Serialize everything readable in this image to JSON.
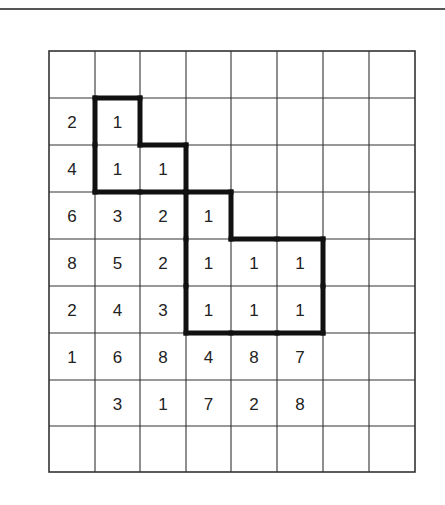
{
  "puzzle": {
    "columns": 8,
    "rows": 9,
    "grid": [
      [
        "",
        "",
        "",
        "",
        "",
        "",
        "",
        ""
      ],
      [
        "2",
        "1",
        "",
        "",
        "",
        "",
        "",
        ""
      ],
      [
        "4",
        "1",
        "1",
        "",
        "",
        "",
        "",
        ""
      ],
      [
        "6",
        "3",
        "2",
        "1",
        "",
        "",
        "",
        ""
      ],
      [
        "8",
        "5",
        "2",
        "1",
        "1",
        "1",
        "",
        ""
      ],
      [
        "2",
        "4",
        "3",
        "1",
        "1",
        "1",
        "",
        ""
      ],
      [
        "1",
        "6",
        "8",
        "4",
        "8",
        "7",
        "",
        ""
      ],
      [
        "",
        "3",
        "1",
        "7",
        "2",
        "8",
        "",
        ""
      ],
      [
        "",
        "",
        "",
        "",
        "",
        "",
        "",
        ""
      ]
    ],
    "outlined_regions": [
      {
        "cells": [
          [
            1,
            1
          ],
          [
            2,
            1
          ],
          [
            2,
            2
          ]
        ]
      },
      {
        "cells": [
          [
            3,
            3
          ],
          [
            4,
            3
          ],
          [
            4,
            4
          ],
          [
            4,
            5
          ],
          [
            5,
            3
          ],
          [
            5,
            4
          ],
          [
            5,
            5
          ]
        ]
      }
    ],
    "colors": {
      "grid_line": "#333333",
      "outline": "#111111",
      "text": "#222222",
      "background": "#ffffff"
    }
  }
}
